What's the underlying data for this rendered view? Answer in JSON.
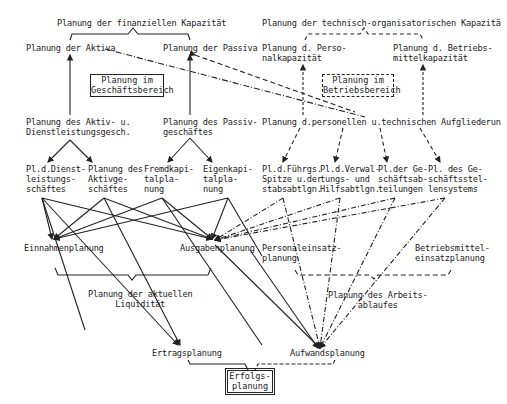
{
  "financial": {
    "title": "Planung der finanziellen Kapazität",
    "aktiva": "Planung der Aktiva",
    "passiva": "Planung der Passiva",
    "center_box": "Planung im\nGeschäftsbereich",
    "aktiv_geschaefte": "Planung des Aktiv- u.\nDienstleistungsgesch.",
    "passiv_geschaefte": "Planung des Passiv-\ngeschäftes",
    "sub": [
      "Pl.d.Dienst-\nleistungs-\nschäftes",
      "Planung des\nAktivge-\nschäftes",
      "Fremdkapi-\ntalpla-\nnung",
      "Eigenkapi-\ntalpla-\nnung"
    ]
  },
  "technical": {
    "title": "Planung der technisch-organisatorischen Kapazitä",
    "personal": "Planung d. Perso-\nnalkapazität",
    "betriebsmittel": "Planung d. Betriebs-\nmittelkapazität",
    "center_box": "Planung im\nBetriebsbereich",
    "aufgliederung": "Planung d.personellen u.technischen Aufgliederun",
    "sub": [
      "Pl.d.Führgs.\nSpitze u.der\nstabsabtlgn.",
      "Pl.d.Verwal-\ntungs- und\nHilfsabtlgn.",
      "Pl.der Ge-\nschäftsab-\nteilungen",
      "Pl. des Ge-\nschäftsstel-\nlensystems"
    ]
  },
  "middle": {
    "einnahmen": "Einnahmenplanung",
    "ausgaben": "Ausgabenplanung",
    "personaleinsatz": "Personaleinsatz-\nplanung",
    "betriebsmitteleinsatz": "Betriebsmittel-\neinsatzplanung",
    "liquiditaet": "Planung der aktuellen\nLiquidität",
    "arbeitsablauf": "Planung des Arbeits-\nablaufes"
  },
  "bottom": {
    "ertrag": "Ertragsplanung",
    "aufwand": "Aufwandsplanung",
    "erfolg": "Erfolgs-\nplanung"
  }
}
